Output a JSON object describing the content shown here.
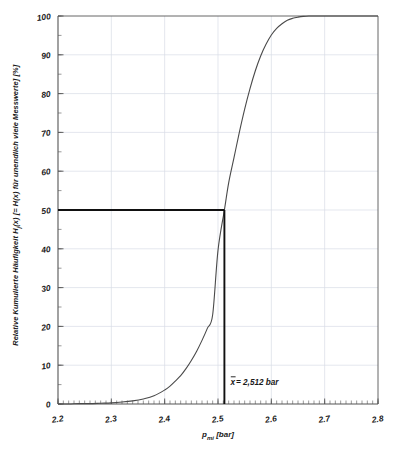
{
  "chart_data": {
    "type": "line",
    "title": "",
    "xlabel": "p_mi [bar]",
    "xlabel_main": "p",
    "xlabel_sub": "mi",
    "xlabel_unit": " [bar]",
    "ylabel": "Relative Kumulierte Häufigkeit Hj(x) [= H(x) für unendlich viele Messwerte] [%]",
    "ylabel_part1": "Relative Kumulierte Häufigkeit H",
    "ylabel_sub": "j",
    "ylabel_part2": "(x) [= H(x) für unendlich viele Messwerte] [%]",
    "xlim": [
      2.2,
      2.8
    ],
    "ylim": [
      0,
      100
    ],
    "xticks": [
      2.2,
      2.3,
      2.4,
      2.5,
      2.6,
      2.7,
      2.8
    ],
    "xtick_labels": [
      "2.2",
      "2.3",
      "2.4",
      "2.5",
      "2.6",
      "2.7",
      "2.8"
    ],
    "yticks": [
      0,
      10,
      20,
      30,
      40,
      50,
      60,
      70,
      80,
      90,
      100
    ],
    "ytick_labels": [
      "0",
      "10",
      "20",
      "30",
      "40",
      "50",
      "60",
      "70",
      "80",
      "90",
      "100"
    ],
    "x_minor_per_major": 10,
    "y_minor_per_major": 2,
    "grid": true,
    "grid_color": "#d9dde6",
    "legend": null,
    "curve_color": "#4a4a4a",
    "marker_color": "#111111",
    "series": [
      {
        "name": "Kumulierte Häufigkeit H(x)",
        "distribution": "normal-cdf",
        "mean": 2.512,
        "sigma": 0.0455,
        "x": [
          2.2,
          2.22,
          2.24,
          2.26,
          2.28,
          2.3,
          2.32,
          2.34,
          2.36,
          2.38,
          2.4,
          2.41,
          2.42,
          2.43,
          2.44,
          2.45,
          2.46,
          2.47,
          2.48,
          2.49,
          2.5,
          2.512,
          2.52,
          2.53,
          2.54,
          2.55,
          2.56,
          2.57,
          2.58,
          2.59,
          2.6,
          2.61,
          2.62,
          2.63,
          2.64,
          2.65,
          2.66,
          2.67,
          2.68,
          2.7,
          2.72,
          2.75,
          2.8
        ],
        "y": [
          0.0,
          0.0,
          0.1,
          0.1,
          0.2,
          0.3,
          0.5,
          0.8,
          1.3,
          2.1,
          3.6,
          4.6,
          5.9,
          7.3,
          9.1,
          11.2,
          13.6,
          16.4,
          19.5,
          23.0,
          39.6,
          50.0,
          57.0,
          63.5,
          70.0,
          76.0,
          81.3,
          85.9,
          89.7,
          92.7,
          95.1,
          96.8,
          98.0,
          98.9,
          99.4,
          99.7,
          99.9,
          100.0,
          100.0,
          100.0,
          100.0,
          100.0,
          100.0
        ]
      }
    ],
    "annotations": [
      {
        "name": "mean-marker",
        "text": "x̄ = 2,512 bar",
        "text_symbol": "x",
        "text_rest": " = 2,512 bar",
        "x": 2.512,
        "y": 50,
        "type": "median-crosshair",
        "h_line_from_x": 2.2,
        "v_line_to_y": 0
      }
    ]
  },
  "figure": {
    "background": "#ffffff",
    "axis_color": "#555555"
  }
}
